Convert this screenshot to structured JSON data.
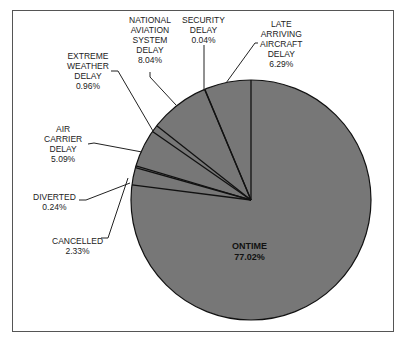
{
  "chart_data": {
    "type": "pie",
    "title": "",
    "slices": [
      {
        "label": "ONTIME",
        "value": 77.02,
        "display": "77.02%"
      },
      {
        "label": "CANCELLED",
        "value": 2.33,
        "display": "2.33%"
      },
      {
        "label": "DIVERTED",
        "value": 0.24,
        "display": "0.24%"
      },
      {
        "label": "AIR CARRIER DELAY",
        "value": 5.09,
        "display": "5.09%"
      },
      {
        "label": "EXTREME WEATHER DELAY",
        "value": 0.96,
        "display": "0.96%"
      },
      {
        "label": "NATIONAL AVIATION SYSTEM DELAY",
        "value": 8.04,
        "display": "8.04%"
      },
      {
        "label": "SECURITY DELAY",
        "value": 0.04,
        "display": "0.04%"
      },
      {
        "label": "LATE ARRIVING AIRCRAFT DELAY",
        "value": 6.29,
        "display": "6.29%"
      }
    ],
    "fill_color": "#777777",
    "edge_color": "#111111",
    "legend": "none",
    "start_angle": "12 o'clock, clockwise"
  },
  "labels": {
    "ontime": "ONTIME\n77.02%",
    "cancelled": "CANCELLED\n2.33%",
    "diverted": "DIVERTED\n0.24%",
    "air_carrier": "AIR\nCARRIER\nDELAY\n5.09%",
    "extreme_weather": "EXTREME\nWEATHER\nDELAY\n0.96%",
    "nas": "NATIONAL\nAVIATION\nSYSTEM\nDELAY\n8.04%",
    "security": "SECURITY\nDELAY\n0.04%",
    "late_aircraft": "LATE\nARRIVING\nAIRCRAFT\nDELAY\n6.29%"
  }
}
